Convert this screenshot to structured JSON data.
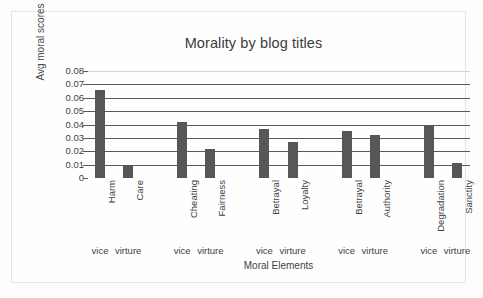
{
  "chart_data": {
    "type": "bar",
    "title": "Morality by blog titles",
    "xlabel": "Moral Elements",
    "ylabel": "Avg moral scores",
    "categories": [
      "Harm",
      "Care",
      "Cheating",
      "Fairness",
      "Betrayal",
      "Loyalty",
      "Betrayal",
      "Authority",
      "Degradation",
      "Sanctity"
    ],
    "values": [
      0.066,
      0.01,
      0.042,
      0.022,
      0.037,
      0.027,
      0.035,
      0.032,
      0.04,
      0.011
    ],
    "group_labels": [
      "vice",
      "virture",
      "vice",
      "virture",
      "vice",
      "virture",
      "vice",
      "virture",
      "vice",
      "virture"
    ],
    "ylim": [
      0,
      0.08
    ],
    "ytick_labels": [
      "0.08",
      "0.07",
      "0.06",
      "0.05",
      "0.04",
      "0.03",
      "0.02",
      "0.01",
      "0"
    ],
    "ytick_values": [
      0.08,
      0.07,
      0.06,
      0.05,
      0.04,
      0.03,
      0.02,
      0.01,
      0
    ],
    "grid": true,
    "legend": "none",
    "bar_color": "#575757",
    "gridline_color": "#59595b",
    "top_gridline_color": "#d2d2d2",
    "text_color": "#3f3f3f",
    "title_color": "#3b3b3b",
    "background_color": "#fefefe"
  }
}
